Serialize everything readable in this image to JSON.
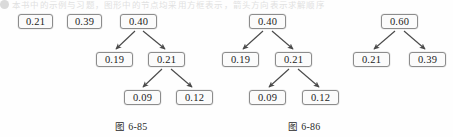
{
  "page": {
    "width": 453,
    "height": 137,
    "background": "#fefefe",
    "top_strip_text": "本书中的示例与习题，图形中的节点均采用方框表示，箭头方向表示求解顺序"
  },
  "figures": [
    {
      "id": "fig-6-85",
      "caption": "图 6-85",
      "caption_label": "图",
      "caption_number": "6-85",
      "caption_x": 115,
      "caption_y": 119,
      "nodes": [
        {
          "id": "f1-n1",
          "label": "0.21",
          "x": 18,
          "y": 14,
          "w": 35,
          "h": 15
        },
        {
          "id": "f1-n2",
          "label": "0.39",
          "x": 67,
          "y": 14,
          "w": 35,
          "h": 15
        },
        {
          "id": "f1-n3",
          "label": "0.40",
          "x": 120,
          "y": 14,
          "w": 37,
          "h": 15
        },
        {
          "id": "f1-n4",
          "label": "0.19",
          "x": 96,
          "y": 52,
          "w": 37,
          "h": 15
        },
        {
          "id": "f1-n5",
          "label": "0.21",
          "x": 148,
          "y": 52,
          "w": 37,
          "h": 15
        },
        {
          "id": "f1-n6",
          "label": "0.09",
          "x": 124,
          "y": 90,
          "w": 37,
          "h": 15
        },
        {
          "id": "f1-n7",
          "label": "0.12",
          "x": 176,
          "y": 90,
          "w": 37,
          "h": 15
        }
      ],
      "edges": [
        {
          "from": "f1-n3",
          "to": "f1-n4",
          "x1": 135,
          "y1": 31,
          "x2": 116,
          "y2": 49
        },
        {
          "from": "f1-n3",
          "to": "f1-n5",
          "x1": 143,
          "y1": 31,
          "x2": 165,
          "y2": 49
        },
        {
          "from": "f1-n5",
          "to": "f1-n6",
          "x1": 162,
          "y1": 69,
          "x2": 143,
          "y2": 87
        },
        {
          "from": "f1-n5",
          "to": "f1-n7",
          "x1": 171,
          "y1": 69,
          "x2": 192,
          "y2": 87
        }
      ]
    },
    {
      "id": "fig-6-86-left",
      "caption": "图 6-86",
      "caption_label": "图",
      "caption_number": "6-86",
      "caption_x": 288,
      "caption_y": 119,
      "nodes": [
        {
          "id": "f2-n1",
          "label": "0.40",
          "x": 249,
          "y": 14,
          "w": 37,
          "h": 15
        },
        {
          "id": "f2-n2",
          "label": "0.19",
          "x": 222,
          "y": 52,
          "w": 37,
          "h": 15
        },
        {
          "id": "f2-n3",
          "label": "0.21",
          "x": 275,
          "y": 52,
          "w": 37,
          "h": 15
        },
        {
          "id": "f2-n4",
          "label": "0.09",
          "x": 249,
          "y": 90,
          "w": 37,
          "h": 15
        },
        {
          "id": "f2-n5",
          "label": "0.12",
          "x": 302,
          "y": 90,
          "w": 37,
          "h": 15
        },
        {
          "id": "f3-n1",
          "label": "0.60",
          "x": 381,
          "y": 14,
          "w": 37,
          "h": 15
        },
        {
          "id": "f3-n2",
          "label": "0.21",
          "x": 353,
          "y": 52,
          "w": 37,
          "h": 15
        },
        {
          "id": "f3-n3",
          "label": "0.39",
          "x": 409,
          "y": 52,
          "w": 37,
          "h": 15
        }
      ],
      "edges": [
        {
          "from": "f2-n1",
          "to": "f2-n2",
          "x1": 263,
          "y1": 31,
          "x2": 243,
          "y2": 49
        },
        {
          "from": "f2-n1",
          "to": "f2-n3",
          "x1": 272,
          "y1": 31,
          "x2": 293,
          "y2": 49
        },
        {
          "from": "f2-n3",
          "to": "f2-n4",
          "x1": 289,
          "y1": 69,
          "x2": 269,
          "y2": 87
        },
        {
          "from": "f2-n3",
          "to": "f2-n5",
          "x1": 298,
          "y1": 69,
          "x2": 319,
          "y2": 87
        },
        {
          "from": "f3-n1",
          "to": "f3-n2",
          "x1": 395,
          "y1": 31,
          "x2": 374,
          "y2": 49
        },
        {
          "from": "f3-n1",
          "to": "f3-n3",
          "x1": 404,
          "y1": 31,
          "x2": 425,
          "y2": 49
        }
      ]
    }
  ],
  "style": {
    "node_border_color": "#8c8c8c",
    "node_fill": "#fbfbfb",
    "text_color": "#1b1b1b",
    "arrow_color": "#4a4a4a"
  }
}
